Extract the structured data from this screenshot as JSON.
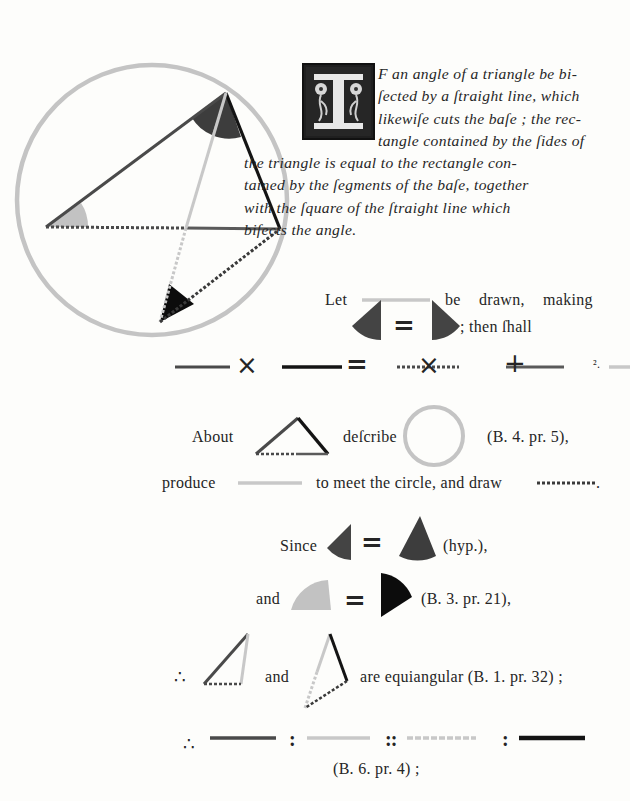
{
  "proposition": {
    "initial_letter": "I",
    "lines": [
      "F an angle of a triangle be bi-",
      "ſected by a ſtraight line, which",
      "likewiſe cuts the baſe ; the rec-",
      "tangle contained by the ſides of",
      "the triangle is equal to the rectangle con-",
      "tained by the ſegments of the baſe, together",
      "with the ſquare of the ſtraight line which",
      "biſects the angle."
    ]
  },
  "proof": {
    "let": "Let",
    "be_drawn": "be drawn, making",
    "then_shall": "; then ſhall",
    "equals": "=",
    "times": "×",
    "plus": "+",
    "squared": "².",
    "about": "About",
    "describe": "deſcribe",
    "ref_b4_pr5": "(B. 4. pr. 5),",
    "produce": "produce",
    "to_meet": "to meet the circle, and draw",
    "period": ".",
    "since": "Since",
    "hyp": "(hyp.),",
    "and1": "and",
    "ref_b3_pr21": "(B. 3. pr. 21),",
    "therefore": "∴",
    "and2": "and",
    "equiangular": "are equiangular (B. 1. pr. 32) ;",
    "colon": ":",
    "double_colon": "::",
    "ref_b6_pr4": "(B. 6. pr. 4) ;"
  },
  "colors": {
    "circle": "#c4c4c4",
    "side_dark": "#4a4a4a",
    "side_black": "#141414",
    "bisector": "#c8c8c8",
    "angle_dark": "#3d3d3d",
    "angle_light": "#c2c2c2",
    "angle_black": "#0c0c0c",
    "dotted": "#4a4a4a",
    "base_right": "#5a5a5a"
  }
}
